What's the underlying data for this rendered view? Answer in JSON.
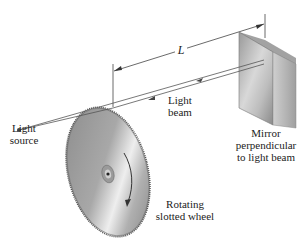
{
  "labels": {
    "distance": "L",
    "light_beam_line1": "Light",
    "light_beam_line2": "beam",
    "light_source_line1": "Light",
    "light_source_line2": "source",
    "mirror_line1": "Mirror",
    "mirror_line2": "perpendicular",
    "mirror_line3": "to light beam",
    "wheel_line1": "Rotating",
    "wheel_line2": "slotted wheel"
  },
  "colors": {
    "line": "#333333",
    "mirror_dark": "#8e8e8e",
    "mirror_light": "#e2e2e2",
    "wheel_dark": "#7a7a7a",
    "wheel_light": "#e6e6e6"
  }
}
